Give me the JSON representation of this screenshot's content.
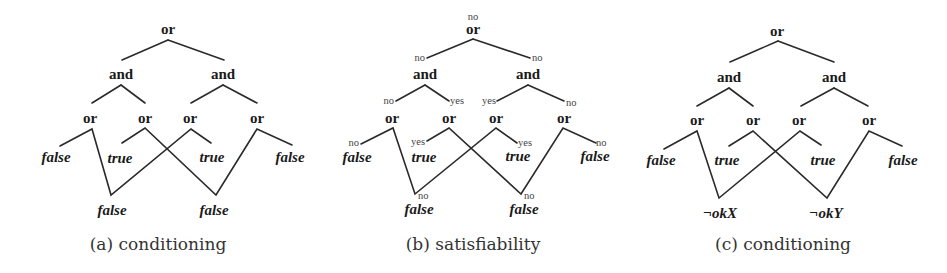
{
  "figure": {
    "colors": {
      "ink": "#1a1a1a",
      "edge": "#2a2a2a",
      "annotation": "#444444",
      "caption": "#333333",
      "background": "#ffffff"
    },
    "panels": [
      {
        "id": "a",
        "caption": "(a) conditioning",
        "nodes": {
          "root": "or",
          "and_left": "and",
          "and_right": "and",
          "or1": "or",
          "or2": "or",
          "or3": "or",
          "or4": "or",
          "leaf1": "false",
          "leaf2": "true",
          "leaf3": "true",
          "leaf4": "false",
          "shared1": "false",
          "shared2": "false"
        }
      },
      {
        "id": "b",
        "caption": "(b) satisfiability",
        "nodes": {
          "root": "or",
          "and_left": "and",
          "and_right": "and",
          "or1": "or",
          "or2": "or",
          "or3": "or",
          "or4": "or",
          "leaf1": "false",
          "leaf2": "true",
          "leaf3": "true",
          "leaf4": "false",
          "shared1": "false",
          "shared2": "false"
        },
        "annotations": {
          "root": "no",
          "and_left": "no",
          "and_right": "no",
          "or1": "no",
          "or2": "yes",
          "or3": "yes",
          "or4": "no",
          "leaf1": "no",
          "leaf2": "yes",
          "leaf3": "yes",
          "leaf4": "no",
          "shared1": "no",
          "shared2": "no"
        }
      },
      {
        "id": "c",
        "caption": "(c) conditioning",
        "nodes": {
          "root": "or",
          "and_left": "and",
          "and_right": "and",
          "or1": "or",
          "or2": "or",
          "or3": "or",
          "or4": "or",
          "leaf1": "false",
          "leaf2": "true",
          "leaf3": "true",
          "leaf4": "false",
          "shared1": "¬okX",
          "shared2": "¬okY"
        }
      }
    ]
  }
}
